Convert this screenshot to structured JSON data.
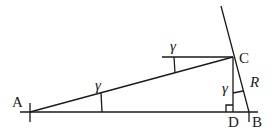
{
  "diagram": {
    "type": "geometry",
    "points": {
      "A": {
        "label": "A",
        "x": 30,
        "y": 112
      },
      "B": {
        "label": "B",
        "x": 249,
        "y": 112
      },
      "C": {
        "label": "C",
        "x": 233,
        "y": 57
      },
      "D": {
        "label": "D",
        "x": 233,
        "y": 112
      }
    },
    "labels": {
      "A": "A",
      "B": "B",
      "C": "C",
      "D": "D",
      "R": "R",
      "angle_at_A": "γ",
      "angle_at_C_horizontal": "γ",
      "angle_at_C_vertical": "γ"
    },
    "colors": {
      "stroke": "#1a1a1a",
      "background": "#ffffff"
    }
  }
}
